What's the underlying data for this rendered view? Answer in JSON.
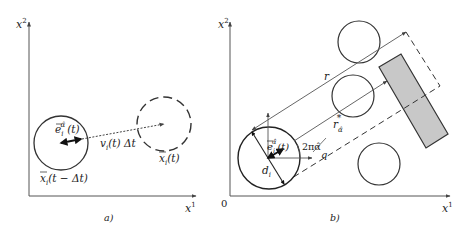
{
  "panel_a": {
    "caption": "a)",
    "axis_x": "x",
    "axis_x_sup": "1",
    "axis_y": "x",
    "axis_y_sup": "2",
    "label_direction": "e",
    "label_direction_sub": "i",
    "label_direction_sup": "α̂",
    "label_direction_arg": "(t)",
    "label_velocity": "v",
    "label_velocity_sub": "i",
    "label_velocity_rest": "(t) Δt",
    "label_new_pos": "x",
    "label_new_pos_sub": "i",
    "label_new_pos_arg": "(t)",
    "label_old_pos": "x",
    "label_old_pos_sub": "i",
    "label_old_pos_arg": "(t − Δt)"
  },
  "panel_b": {
    "caption": "b)",
    "origin": "0",
    "axis_x": "x",
    "axis_x_sup": "1",
    "axis_y": "x",
    "axis_y_sup": "2",
    "label_r": "r",
    "label_r_alpha": "r",
    "label_r_alpha_sub": "α̂",
    "label_r_alpha_star": "*",
    "label_direction": "e",
    "label_direction_sub": "i",
    "label_direction_sup": "α̂",
    "label_direction_arg": "(t)",
    "label_angle": "2πα̂",
    "label_q": "q",
    "label_d": "d",
    "label_d_sub": "i"
  },
  "colors": {
    "stroke": "#333333",
    "ray": "#555555",
    "obstacle_fill": "#c8c8c8",
    "background": "#ffffff"
  }
}
